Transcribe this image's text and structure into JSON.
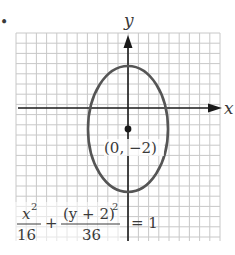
{
  "figure": {
    "bullet": "•",
    "axes": {
      "x_label": "x",
      "y_label": "y",
      "x_range": [
        -11,
        9
      ],
      "y_range": [
        -13,
        7
      ],
      "grid": true,
      "grid_step": 1
    },
    "ellipse": {
      "center": [
        0,
        -2
      ],
      "semi_axis_x": 4,
      "semi_axis_y": 6,
      "center_label": "(0, −2)"
    },
    "equation": {
      "term1_num": "x",
      "term1_num_exp": "2",
      "term1_den": "16",
      "plus": "+",
      "term2_num": "(y + 2)",
      "term2_num_exp": "2",
      "term2_den": "36",
      "equals": "= 1"
    },
    "colors": {
      "grid": "#c8c8c8",
      "axis": "#1a1a1a",
      "ellipse": "#555555",
      "text": "#3a3a3a"
    }
  },
  "chart_data": {
    "type": "diagram",
    "title": "",
    "xlabel": "x",
    "ylabel": "y",
    "grid": true,
    "xlim": [
      -11,
      9
    ],
    "ylim": [
      -13,
      7
    ],
    "shapes": [
      {
        "kind": "ellipse",
        "center": [
          0,
          -2
        ],
        "rx": 4,
        "ry": 6,
        "equation": "x^2/16 + (y+2)^2/36 = 1"
      }
    ],
    "points": [
      {
        "x": 0,
        "y": -2,
        "label": "(0, −2)"
      }
    ],
    "annotations": [
      "x^2/16 + (y + 2)^2/36 = 1"
    ]
  }
}
